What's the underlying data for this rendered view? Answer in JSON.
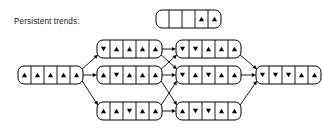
{
  "diagram": {
    "title_label": "Persistent trends:",
    "symbols": {
      "up": "up-triangle",
      "down": "down-triangle",
      "empty": "blank-cell"
    },
    "legend": {
      "name": "legend-node",
      "cells": [
        "empty",
        "empty",
        "empty",
        "up",
        "up"
      ],
      "x": 156,
      "y": 10,
      "cell_w": 13,
      "cell_h": 18
    },
    "nodes": [
      {
        "id": "node-start",
        "label": "start-state",
        "cells": [
          "up",
          "up",
          "up",
          "up",
          "up"
        ],
        "x": 18,
        "y": 66,
        "column": 0,
        "row": 1
      },
      {
        "id": "node-c1-top",
        "label": "column1-top-state",
        "cells": [
          "down",
          "up",
          "up",
          "up",
          "up"
        ],
        "x": 97,
        "y": 40,
        "column": 1,
        "row": 0
      },
      {
        "id": "node-c1-mid",
        "label": "column1-middle-state",
        "cells": [
          "up",
          "down",
          "up",
          "up",
          "up"
        ],
        "x": 97,
        "y": 66,
        "column": 1,
        "row": 1
      },
      {
        "id": "node-c1-bot",
        "label": "column1-bottom-state",
        "cells": [
          "up",
          "up",
          "down",
          "up",
          "up"
        ],
        "x": 97,
        "y": 102,
        "column": 1,
        "row": 2
      },
      {
        "id": "node-c2-top",
        "label": "column2-top-state",
        "cells": [
          "down",
          "down",
          "up",
          "up",
          "up"
        ],
        "x": 176,
        "y": 40,
        "column": 2,
        "row": 0
      },
      {
        "id": "node-c2-mid",
        "label": "column2-middle-state",
        "cells": [
          "down",
          "up",
          "down",
          "up",
          "up"
        ],
        "x": 176,
        "y": 66,
        "column": 2,
        "row": 1
      },
      {
        "id": "node-c2-bot",
        "label": "column2-bottom-state",
        "cells": [
          "up",
          "down",
          "down",
          "up",
          "up"
        ],
        "x": 176,
        "y": 102,
        "column": 2,
        "row": 2
      },
      {
        "id": "node-end",
        "label": "final-state",
        "cells": [
          "down",
          "down",
          "down",
          "up",
          "up"
        ],
        "x": 256,
        "y": 66,
        "column": 3,
        "row": 1
      }
    ],
    "edges": [
      {
        "from": "node-start",
        "to": "node-c1-top",
        "name": "edge-start-to-c1-top"
      },
      {
        "from": "node-start",
        "to": "node-c1-mid",
        "name": "edge-start-to-c1-mid"
      },
      {
        "from": "node-start",
        "to": "node-c1-bot",
        "name": "edge-start-to-c1-bot"
      },
      {
        "from": "node-c1-top",
        "to": "node-c2-top",
        "name": "edge-c1-top-to-c2-top"
      },
      {
        "from": "node-c1-top",
        "to": "node-c2-mid",
        "name": "edge-c1-top-to-c2-mid"
      },
      {
        "from": "node-c1-mid",
        "to": "node-c2-top",
        "name": "edge-c1-mid-to-c2-top"
      },
      {
        "from": "node-c1-mid",
        "to": "node-c2-mid",
        "name": "edge-c1-mid-to-c2-mid"
      },
      {
        "from": "node-c1-mid",
        "to": "node-c2-bot",
        "name": "edge-c1-mid-to-c2-bot"
      },
      {
        "from": "node-c1-bot",
        "to": "node-c2-mid",
        "name": "edge-c1-bot-to-c2-mid"
      },
      {
        "from": "node-c1-bot",
        "to": "node-c2-bot",
        "name": "edge-c1-bot-to-c2-bot"
      },
      {
        "from": "node-c2-top",
        "to": "node-end",
        "name": "edge-c2-top-to-end"
      },
      {
        "from": "node-c2-mid",
        "to": "node-end",
        "name": "edge-c2-mid-to-end"
      },
      {
        "from": "node-c2-bot",
        "to": "node-end",
        "name": "edge-c2-bot-to-end"
      }
    ],
    "geometry": {
      "cell_w": 13,
      "cell_h": 18,
      "corner_radius": 6,
      "title_x": 14,
      "title_y": 24
    },
    "colors": {
      "stroke": "#000000",
      "fill": "#ffffff",
      "text": "#1a1a1a",
      "symbol": "#000000"
    }
  }
}
